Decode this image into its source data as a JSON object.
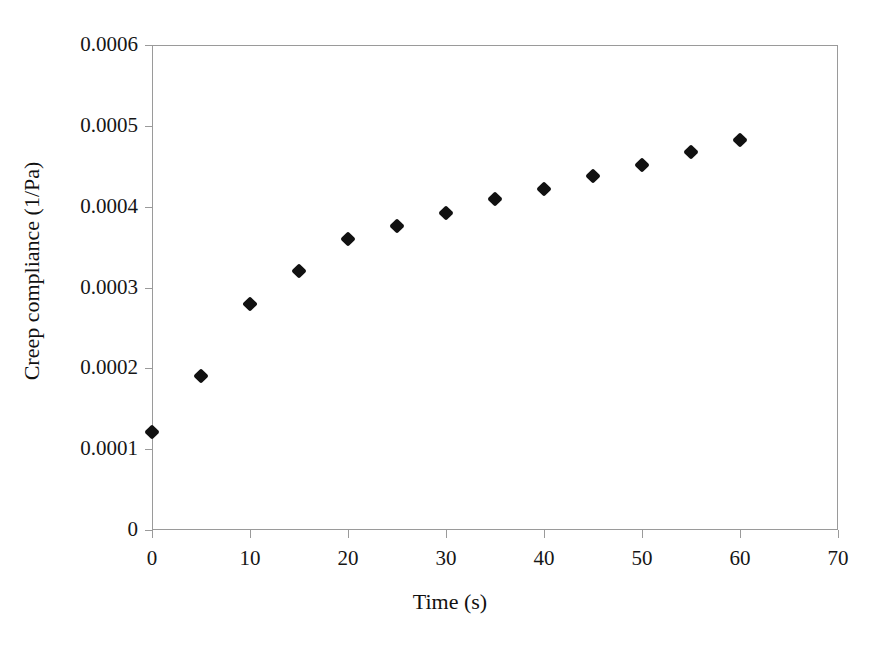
{
  "chart_data": {
    "type": "scatter",
    "title": "",
    "xlabel": "Time (s)",
    "ylabel": "Creep compliance (1/Pa)",
    "xlim": [
      0,
      70
    ],
    "ylim": [
      0,
      0.0006
    ],
    "grid": false,
    "legend": null,
    "marker": "diamond",
    "marker_color": "#111111",
    "axis_color": "#9a9a9a",
    "xticks": [
      0,
      10,
      20,
      30,
      40,
      50,
      60,
      70
    ],
    "xtick_labels": [
      "0",
      "10",
      "20",
      "30",
      "40",
      "50",
      "60",
      "70"
    ],
    "yticks": [
      0,
      0.0001,
      0.0002,
      0.0003,
      0.0004,
      0.0005,
      0.0006
    ],
    "ytick_labels": [
      "0",
      "0.0001",
      "0.0002",
      "0.0003",
      "0.0004",
      "0.0005",
      "0.0006"
    ],
    "x": [
      0,
      5,
      10,
      15,
      20,
      25,
      30,
      35,
      40,
      45,
      50,
      55,
      60
    ],
    "y": [
      0.000121,
      0.00019,
      0.00028,
      0.00032,
      0.00036,
      0.000376,
      0.000392,
      0.000409,
      0.000422,
      0.000438,
      0.000452,
      0.000468,
      0.000483
    ],
    "points": [
      {
        "x": 0,
        "y": 0.000121
      },
      {
        "x": 5,
        "y": 0.00019
      },
      {
        "x": 10,
        "y": 0.00028
      },
      {
        "x": 15,
        "y": 0.00032
      },
      {
        "x": 20,
        "y": 0.00036
      },
      {
        "x": 25,
        "y": 0.000376
      },
      {
        "x": 30,
        "y": 0.000392
      },
      {
        "x": 35,
        "y": 0.000409
      },
      {
        "x": 40,
        "y": 0.000422
      },
      {
        "x": 45,
        "y": 0.000438
      },
      {
        "x": 50,
        "y": 0.000452
      },
      {
        "x": 55,
        "y": 0.000468
      },
      {
        "x": 60,
        "y": 0.000483
      }
    ]
  }
}
